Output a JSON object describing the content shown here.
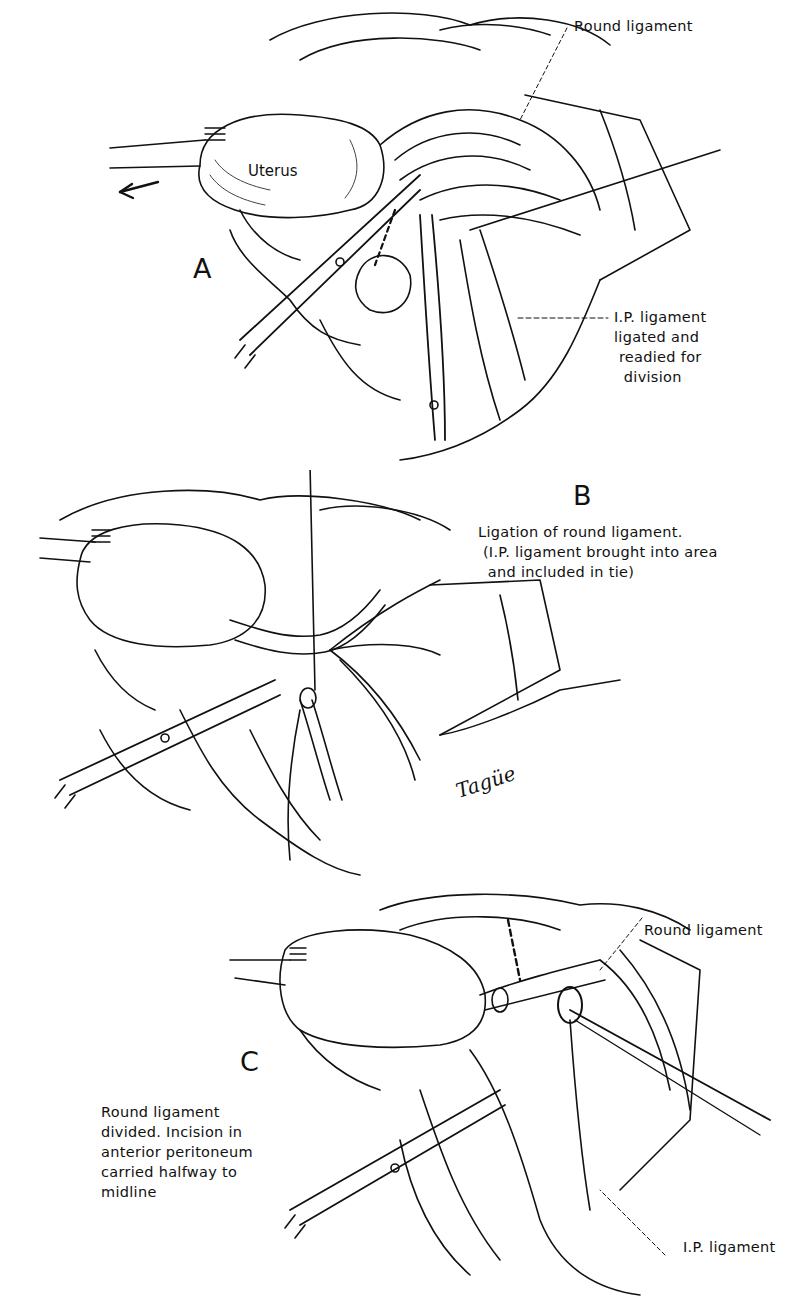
{
  "figure": {
    "panels": [
      {
        "letter": "A",
        "labels": {
          "organ": "Uterus",
          "round_ligament": "Round ligament",
          "ip_ligament": "I.P. ligament\nligated and\n readied for\n  division"
        }
      },
      {
        "letter": "B",
        "labels": {
          "caption": "Ligation of round ligament.\n (I.P. ligament brought into area\n  and included in tie)"
        },
        "signature": "Tagüe"
      },
      {
        "letter": "C",
        "labels": {
          "round_ligament": "Round ligament",
          "caption": "Round ligament\ndivided. Incision in\nanterior peritoneum\ncarried halfway to\nmidline",
          "ip_ligament": "I.P. ligament"
        }
      }
    ]
  },
  "colors": {
    "ink": "#111111",
    "background": "#ffffff"
  }
}
